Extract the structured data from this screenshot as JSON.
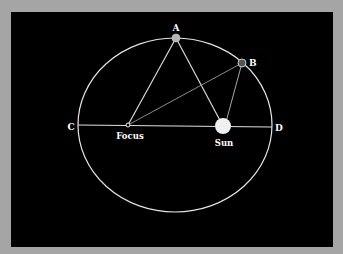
{
  "diagram": {
    "colors": {
      "background": "#a5a5a5",
      "panel": "#000000",
      "lines": "#e6e6e6",
      "point_a": "#b4b4b4",
      "point_b": "#555555",
      "sun": "#f0f0f0",
      "labels": "#ffffff"
    },
    "ellipse": {
      "cx": 175,
      "cy": 125,
      "rx": 97,
      "ry": 87
    },
    "points": {
      "A": {
        "label": "A",
        "x": 176,
        "y": 38
      },
      "B": {
        "label": "B",
        "x": 242,
        "y": 63
      },
      "C": {
        "label": "C",
        "x": 78,
        "y": 125
      },
      "D": {
        "label": "D",
        "x": 272,
        "y": 127
      },
      "focus": {
        "label": "Focus",
        "x": 128,
        "y": 125
      },
      "sun": {
        "label": "Sun",
        "x": 223,
        "y": 126
      }
    },
    "labels": {
      "a": "A",
      "b": "B",
      "c": "C",
      "d": "D",
      "focus": "Focus",
      "sun": "Sun"
    }
  }
}
